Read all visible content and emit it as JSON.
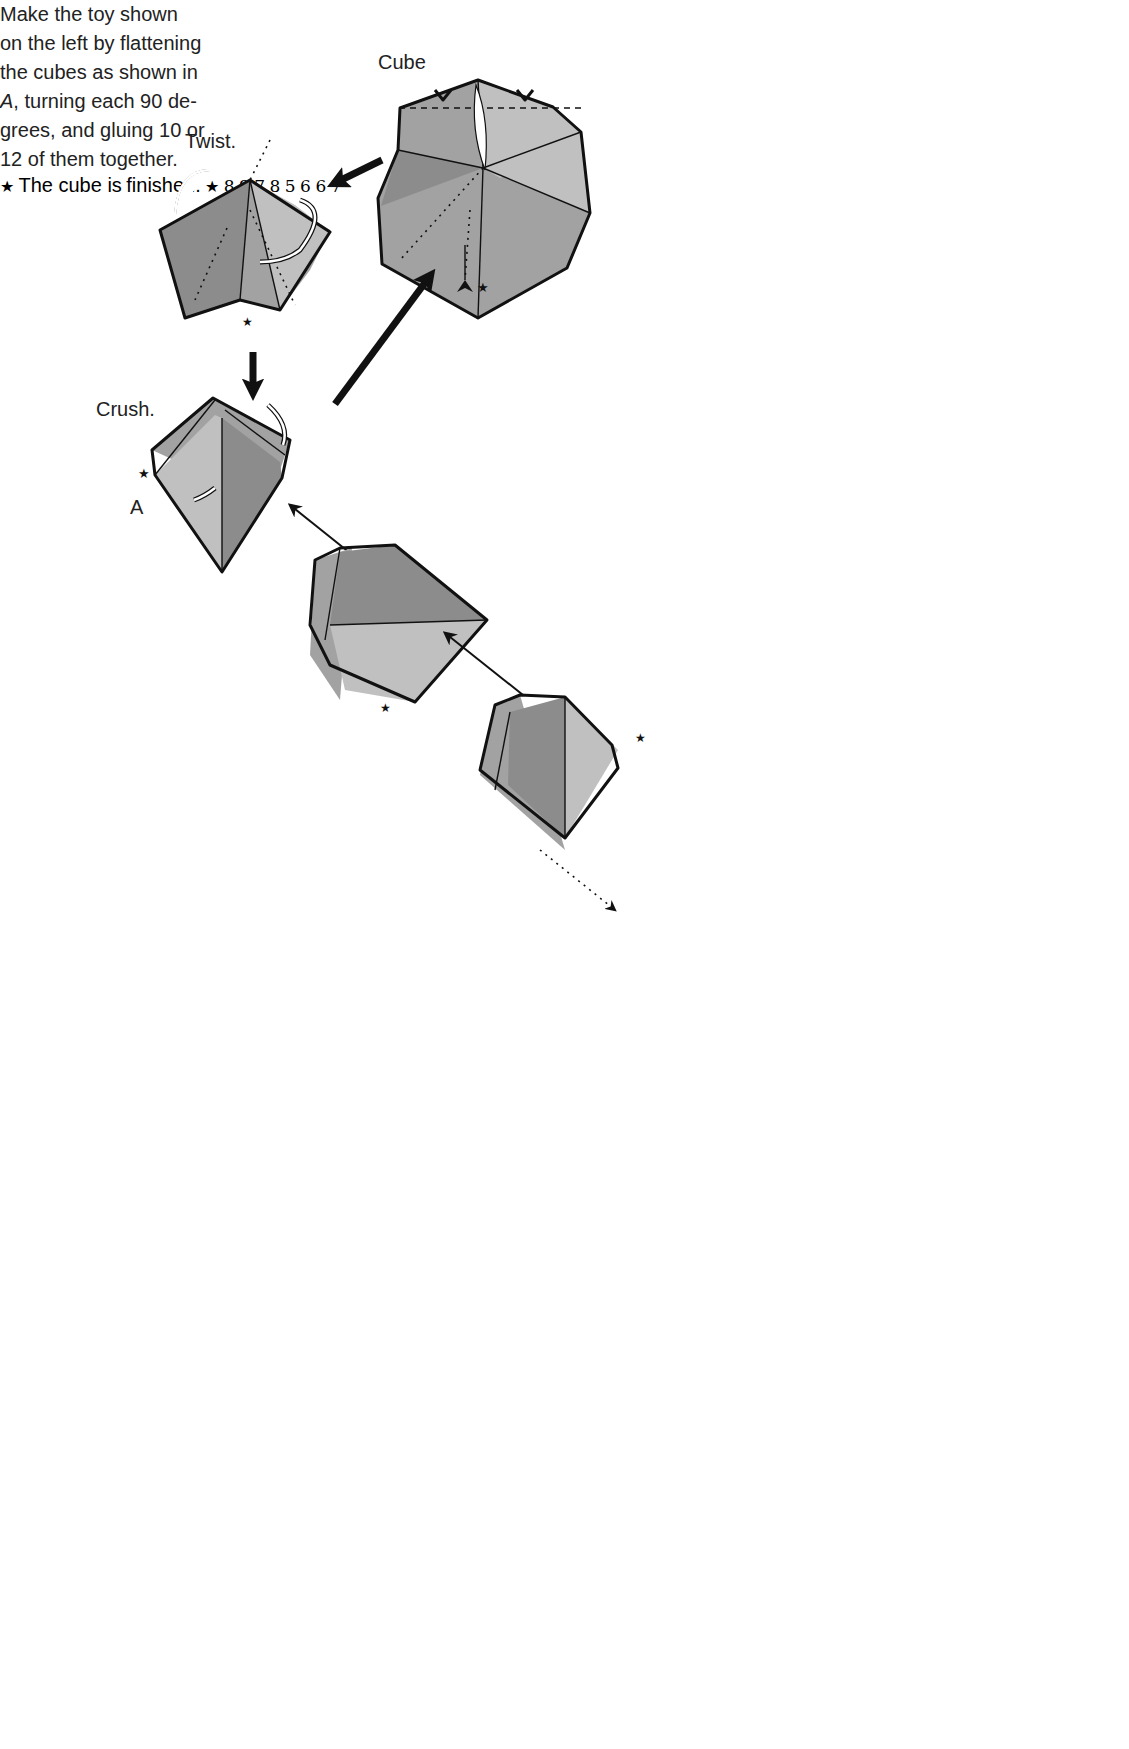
{
  "labels": {
    "cube": "Cube",
    "twist": "Twist.",
    "crush": "Crush.",
    "point_a": "A",
    "finished_line1": "The cube is",
    "finished_line2": "finished."
  },
  "instructions": {
    "line1": "Make the toy shown",
    "line2": "on the left by flattening",
    "line3": "the cubes as shown in",
    "line4_italic": "A",
    "line4_rest": ", turning each 90 de-",
    "line5": "grees, and gluing 10 or",
    "line6": "12 of them together."
  },
  "steps": {
    "row1": {
      "left": "5",
      "right": "6"
    },
    "row2": {
      "left": "6",
      "right": "7"
    },
    "assembly": {
      "step7": "7",
      "step8_top": "8",
      "step9": "9",
      "step8_bottom": "8"
    }
  },
  "markers": {
    "star": "★",
    "turn_over_symbol": "turn-over"
  },
  "colors": {
    "dark_paper": "#8c8c8c",
    "mid_paper": "#a2a2a2",
    "light_paper": "#c0c0c0",
    "line": "#111111",
    "background": "#ffffff"
  }
}
